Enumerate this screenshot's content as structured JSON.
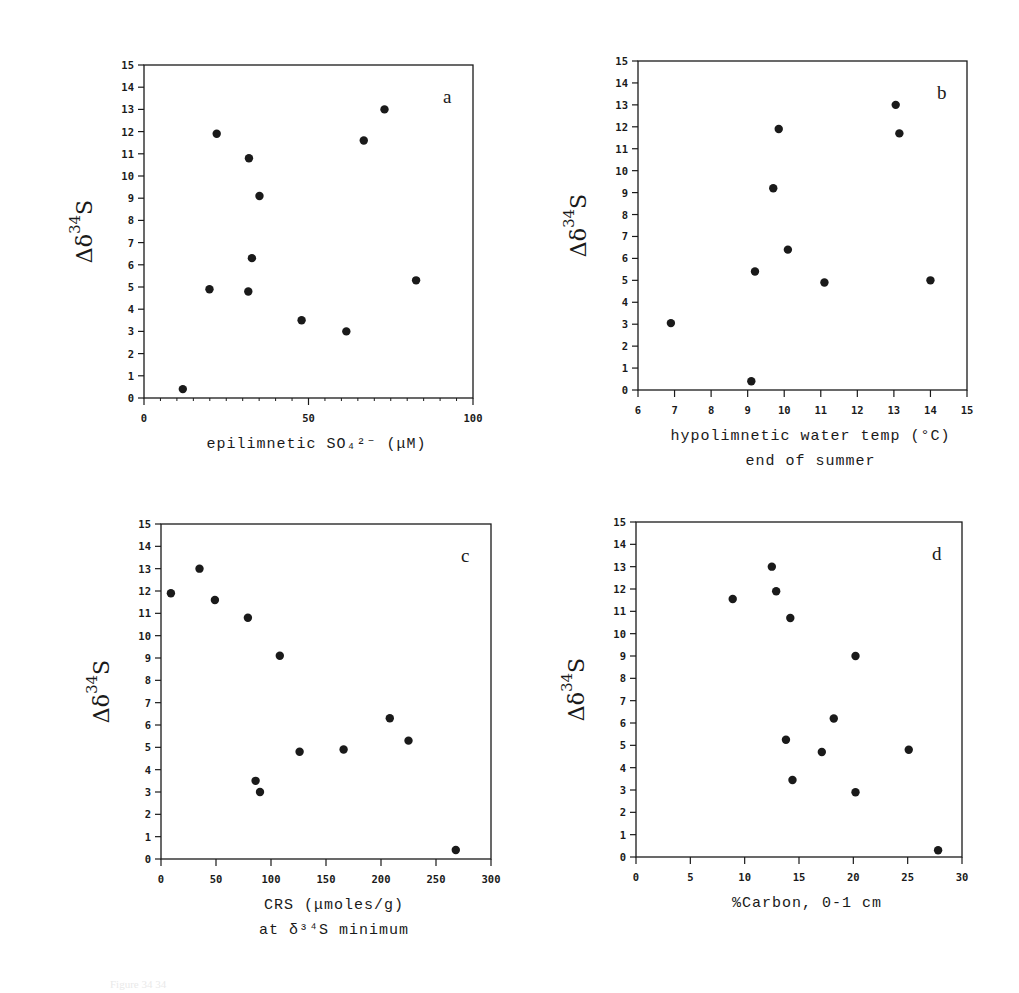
{
  "figure": {
    "caption_fragment": "Figure                              34                           34"
  },
  "panels": [
    {
      "id": "a",
      "letter": "a",
      "ylabel": {
        "delta": "Δδ",
        "sup": "34",
        "s": "S"
      },
      "xlabel_lines": [
        "epilimnetic SO₄²⁻ (μM)"
      ],
      "yticks": [
        "0",
        "1",
        "2",
        "3",
        "4",
        "5",
        "6",
        "7",
        "8",
        "9",
        "10",
        "11",
        "12",
        "13",
        "14",
        "15"
      ],
      "xticks": [
        "0",
        "50",
        "100"
      ]
    },
    {
      "id": "b",
      "letter": "b",
      "ylabel": {
        "delta": "Δδ",
        "sup": "34",
        "s": "S"
      },
      "xlabel_lines": [
        "hypolimnetic water temp (°C)",
        "end of summer"
      ],
      "yticks": [
        "0",
        "1",
        "2",
        "3",
        "4",
        "5",
        "6",
        "7",
        "8",
        "9",
        "10",
        "11",
        "12",
        "13",
        "14",
        "15"
      ],
      "xticks": [
        "6",
        "7",
        "8",
        "9",
        "10",
        "11",
        "12",
        "13",
        "14",
        "15"
      ]
    },
    {
      "id": "c",
      "letter": "c",
      "ylabel": {
        "delta": "Δδ",
        "sup": "34",
        "s": "S"
      },
      "xlabel_lines": [
        "CRS (μmoles/g)",
        "at δ³⁴S minimum"
      ],
      "yticks": [
        "0",
        "1",
        "2",
        "3",
        "4",
        "5",
        "6",
        "7",
        "8",
        "9",
        "10",
        "11",
        "12",
        "13",
        "14",
        "15"
      ],
      "xticks": [
        "0",
        "50",
        "100",
        "150",
        "200",
        "250",
        "300"
      ]
    },
    {
      "id": "d",
      "letter": "d",
      "ylabel": {
        "delta": "Δδ",
        "sup": "34",
        "s": "S"
      },
      "xlabel_lines": [
        "%Carbon, 0-1 cm"
      ],
      "yticks": [
        "0",
        "1",
        "2",
        "3",
        "4",
        "5",
        "6",
        "7",
        "8",
        "9",
        "10",
        "11",
        "12",
        "13",
        "14",
        "15"
      ],
      "xticks": [
        "0",
        "5",
        "10",
        "15",
        "20",
        "25",
        "30"
      ]
    }
  ],
  "chart_data": [
    {
      "type": "scatter",
      "panel": "a",
      "title": "",
      "xlabel": "epilimnetic SO4 2- (μM)",
      "ylabel": "Δδ34S",
      "xlim": [
        0,
        100
      ],
      "ylim": [
        0,
        15
      ],
      "xticks": [
        0,
        50,
        100
      ],
      "yticks": [
        0,
        1,
        2,
        3,
        4,
        5,
        6,
        7,
        8,
        9,
        10,
        11,
        12,
        13,
        14,
        15
      ],
      "grid": false,
      "legend": null,
      "annotation": "a",
      "x": [
        11.8,
        19.9,
        22.1,
        31.9,
        31.7,
        32.8,
        35.1,
        47.9,
        61.5,
        66.8,
        73.1,
        82.7
      ],
      "y": [
        0.4,
        4.9,
        11.9,
        10.8,
        4.8,
        6.3,
        9.1,
        3.5,
        3.0,
        11.6,
        13.0,
        5.3
      ]
    },
    {
      "type": "scatter",
      "panel": "b",
      "title": "",
      "xlabel": "hypolimnetic water temp (°C) end of summer",
      "ylabel": "Δδ34S",
      "xlim": [
        6,
        15
      ],
      "ylim": [
        0,
        15
      ],
      "xticks": [
        6,
        7,
        8,
        9,
        10,
        11,
        12,
        13,
        14,
        15
      ],
      "yticks": [
        0,
        1,
        2,
        3,
        4,
        5,
        6,
        7,
        8,
        9,
        10,
        11,
        12,
        13,
        14,
        15
      ],
      "grid": false,
      "legend": null,
      "annotation": "b",
      "x": [
        6.9,
        9.1,
        9.2,
        9.7,
        9.85,
        10.1,
        11.1,
        13.05,
        13.15,
        14.0
      ],
      "y": [
        3.05,
        0.4,
        5.4,
        9.2,
        11.9,
        6.4,
        4.9,
        13.0,
        11.7,
        5.0
      ]
    },
    {
      "type": "scatter",
      "panel": "c",
      "title": "",
      "xlabel": "CRS (μmoles/g) at δ34S minimum",
      "ylabel": "Δδ34S",
      "xlim": [
        0,
        300
      ],
      "ylim": [
        0,
        15
      ],
      "xticks": [
        0,
        50,
        100,
        150,
        200,
        250,
        300
      ],
      "yticks": [
        0,
        1,
        2,
        3,
        4,
        5,
        6,
        7,
        8,
        9,
        10,
        11,
        12,
        13,
        14,
        15
      ],
      "grid": false,
      "legend": null,
      "annotation": "c",
      "x": [
        9,
        35,
        49,
        79,
        86,
        90,
        108,
        126,
        166,
        208,
        225,
        268
      ],
      "y": [
        11.9,
        13.0,
        11.6,
        10.8,
        3.5,
        3.0,
        9.1,
        4.8,
        4.9,
        6.3,
        5.3,
        0.4
      ]
    },
    {
      "type": "scatter",
      "panel": "d",
      "title": "",
      "xlabel": "%Carbon, 0-1 cm",
      "ylabel": "Δδ34S",
      "xlim": [
        0,
        30
      ],
      "ylim": [
        0,
        15
      ],
      "xticks": [
        0,
        5,
        10,
        15,
        20,
        25,
        30
      ],
      "yticks": [
        0,
        1,
        2,
        3,
        4,
        5,
        6,
        7,
        8,
        9,
        10,
        11,
        12,
        13,
        14,
        15
      ],
      "grid": false,
      "legend": null,
      "annotation": "d",
      "x": [
        8.9,
        12.5,
        12.9,
        14.2,
        13.8,
        14.4,
        17.1,
        18.2,
        20.2,
        20.2,
        25.1,
        27.8
      ],
      "y": [
        11.55,
        13.0,
        11.9,
        10.7,
        5.25,
        3.45,
        4.7,
        6.2,
        9.0,
        2.9,
        4.8,
        0.3
      ]
    }
  ],
  "layout": {
    "frames": {
      "a": {
        "x0": 144,
        "y0": 65,
        "x1": 473,
        "y1": 398
      },
      "b": {
        "x0": 638,
        "y0": 61,
        "x1": 967,
        "y1": 390
      },
      "c": {
        "x0": 161,
        "y0": 524,
        "x1": 491,
        "y1": 859
      },
      "d": {
        "x0": 636,
        "y0": 522,
        "x1": 962,
        "y1": 857
      }
    },
    "ink": "#1a1a1a"
  }
}
